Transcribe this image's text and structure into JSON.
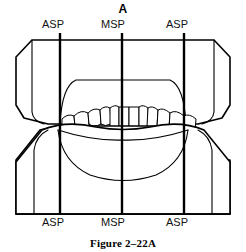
{
  "figure": {
    "panel_letter": "A",
    "caption": "Figure 2–22A"
  },
  "planes": {
    "top_labels": [
      {
        "name": "asp-left",
        "text": "ASP",
        "x": 60
      },
      {
        "name": "msp",
        "text": "MSP",
        "x": 122
      },
      {
        "name": "asp-right",
        "text": "ASP",
        "x": 184
      }
    ],
    "bottom_labels": [
      {
        "name": "asp-left",
        "text": "ASP",
        "x": 60
      },
      {
        "name": "msp",
        "text": "MSP",
        "x": 122
      },
      {
        "name": "asp-right",
        "text": "ASP",
        "x": 184
      }
    ]
  },
  "colors": {
    "ink": "#000000",
    "paper": "#ffffff"
  }
}
